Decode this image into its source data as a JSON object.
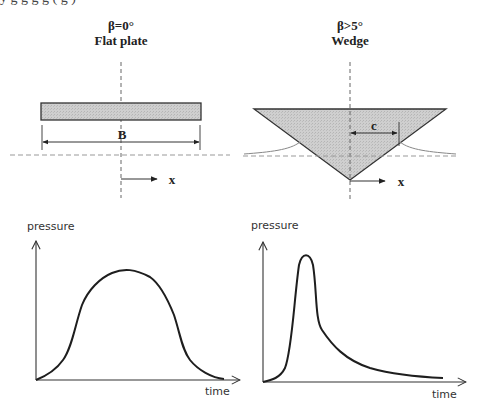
{
  "top_crop": {
    "note_text": "y    g      g g   g     (        g    )"
  },
  "panels": {
    "flat_plate": {
      "angle_label": "β=0°",
      "title": "Flat plate",
      "dimension_label": "B",
      "axis_label": "x"
    },
    "wedge": {
      "angle_label": "β>5°",
      "title": "Wedge",
      "dimension_label": "c",
      "axis_label": "x"
    }
  },
  "plots": {
    "flat_plate_pressure": {
      "y_label": "pressure",
      "x_label": "time",
      "shape": "broad symmetric bell-shaped pressure pulse"
    },
    "wedge_pressure": {
      "y_label": "pressure",
      "x_label": "time",
      "shape": "sharp early peak followed by long decaying tail"
    }
  },
  "colors": {
    "ink": "#222222",
    "fill": "#c8c8c8",
    "dashed": "#777777",
    "background": "#ffffff"
  }
}
